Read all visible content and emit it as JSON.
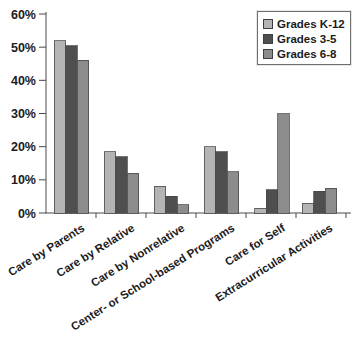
{
  "chart_data": {
    "type": "bar",
    "title": "",
    "xlabel": "",
    "ylabel": "",
    "ylim": [
      0,
      60
    ],
    "y_tick_step": 10,
    "y_ticks": [
      "0%",
      "10%",
      "20%",
      "30%",
      "40%",
      "50%",
      "60%"
    ],
    "grid": false,
    "legend_position": "top-right",
    "categories": [
      "Care by Parents",
      "Care by Relative",
      "Care by Nonrelative",
      "Center- or School-based Programs",
      "Care for Self",
      "Extracurricular Activities"
    ],
    "series": [
      {
        "name": "Grades K-12",
        "color": "#b4b4b4",
        "values": [
          52,
          18.5,
          8,
          20,
          1.5,
          3
        ]
      },
      {
        "name": "Grades 3-5",
        "color": "#4f4f4f",
        "values": [
          50.5,
          17,
          5,
          18.5,
          7,
          6.5
        ]
      },
      {
        "name": "Grades 6-8",
        "color": "#8c8c8c",
        "values": [
          46,
          12,
          2.5,
          12.5,
          30,
          7.5
        ]
      }
    ]
  },
  "colors": {
    "axis": "#4a4a4a",
    "text": "#1b1b1b",
    "background": "#ffffff",
    "bar_border": "#454545"
  }
}
